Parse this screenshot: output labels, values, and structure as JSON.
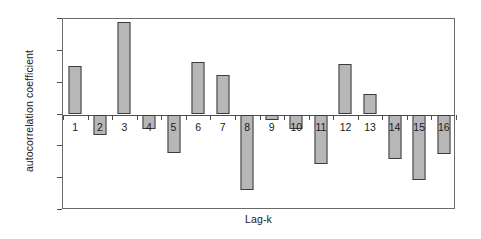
{
  "chart_data": {
    "type": "bar",
    "title": "",
    "xlabel": "Lag-k",
    "ylabel": "autocorrelation coefficient",
    "categories": [
      "1",
      "2",
      "3",
      "4",
      "5",
      "6",
      "7",
      "8",
      "9",
      "10",
      "11",
      "12",
      "13",
      "14",
      "15",
      "16"
    ],
    "values": [
      0.152,
      -0.065,
      0.29,
      -0.045,
      -0.122,
      0.166,
      0.124,
      -0.238,
      -0.016,
      -0.047,
      -0.155,
      0.16,
      0.065,
      -0.141,
      -0.205,
      -0.125
    ],
    "series": [
      {
        "name": "autocorrelation coefficient",
        "values": [
          0.152,
          -0.065,
          0.29,
          -0.045,
          -0.122,
          0.166,
          0.124,
          -0.238,
          -0.016,
          -0.047,
          -0.155,
          0.16,
          0.065,
          -0.141,
          -0.205,
          -0.125
        ]
      }
    ],
    "ylim": [
      -0.3,
      0.3
    ],
    "ytick_values": [
      0.3,
      0.2,
      0.1,
      0,
      -0.1,
      -0.2,
      -0.3
    ],
    "ytick_labels": [
      "0.3",
      "0.2",
      "0.1",
      "0",
      "-0.1",
      "-0.2",
      "-0.3"
    ],
    "grid": false,
    "legend": false,
    "legend_position": "none",
    "baseline": 0,
    "bar_color": "#b7b7b7",
    "bar_edge_color": "#3d3d3d",
    "axis_color": "#4d4d4d",
    "background_color": "#ffffff"
  }
}
